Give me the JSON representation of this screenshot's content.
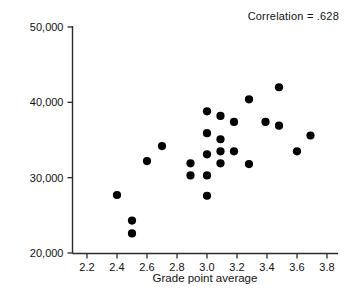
{
  "chart_data": {
    "type": "scatter",
    "title": "",
    "xlabel": "Grade point average",
    "ylabel": "Starting salary",
    "xlim": [
      2.1,
      3.85
    ],
    "ylim": [
      20000,
      50000
    ],
    "grid": false,
    "legend_position": "none",
    "annotations": [
      {
        "name": "correlation",
        "text": "Correlation = .628",
        "position": "top-right"
      }
    ],
    "xticks": [
      2.2,
      2.4,
      2.6,
      2.8,
      3.0,
      3.2,
      3.4,
      3.6,
      3.8
    ],
    "xtick_labels": [
      "2.2",
      "2.4",
      "2.6",
      "2.8",
      "3.0",
      "3.2",
      "3.4",
      "3.6",
      "3.8"
    ],
    "yticks": [
      20000,
      30000,
      40000,
      50000
    ],
    "ytick_labels": [
      "20,000",
      "30,000",
      "40,000",
      "50,000"
    ],
    "marker": {
      "shape": "circle",
      "color": "#000000",
      "size": 4.1
    },
    "points": [
      {
        "x": 2.4,
        "y": 27700
      },
      {
        "x": 2.5,
        "y": 24300
      },
      {
        "x": 2.5,
        "y": 22600
      },
      {
        "x": 2.6,
        "y": 32200
      },
      {
        "x": 2.7,
        "y": 34200
      },
      {
        "x": 2.89,
        "y": 31900
      },
      {
        "x": 2.89,
        "y": 30300
      },
      {
        "x": 3.0,
        "y": 38800
      },
      {
        "x": 3.0,
        "y": 35900
      },
      {
        "x": 3.0,
        "y": 33100
      },
      {
        "x": 3.0,
        "y": 30300
      },
      {
        "x": 3.0,
        "y": 27600
      },
      {
        "x": 3.09,
        "y": 38200
      },
      {
        "x": 3.09,
        "y": 35100
      },
      {
        "x": 3.09,
        "y": 33500
      },
      {
        "x": 3.09,
        "y": 31900
      },
      {
        "x": 3.18,
        "y": 37400
      },
      {
        "x": 3.18,
        "y": 33500
      },
      {
        "x": 3.28,
        "y": 40400
      },
      {
        "x": 3.28,
        "y": 31800
      },
      {
        "x": 3.39,
        "y": 37400
      },
      {
        "x": 3.48,
        "y": 42000
      },
      {
        "x": 3.48,
        "y": 36900
      },
      {
        "x": 3.6,
        "y": 33500
      },
      {
        "x": 3.69,
        "y": 35600
      }
    ]
  },
  "axis_colors": {
    "axis": "#2b2b2b",
    "marker": "#000000",
    "text": "#111111",
    "background": "#ffffff"
  }
}
